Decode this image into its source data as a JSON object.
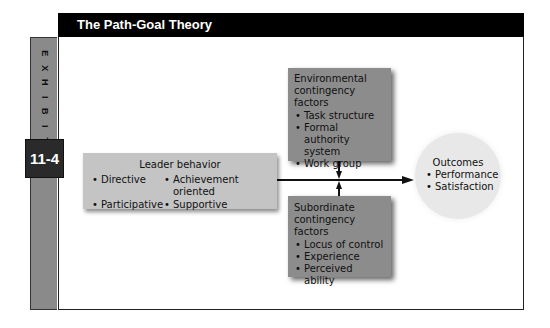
{
  "header": {
    "title": "The Path-Goal Theory"
  },
  "exhibit": {
    "letters": [
      "E",
      "X",
      "H",
      "I",
      "B",
      "I",
      "T"
    ],
    "number": "11-4"
  },
  "leader_behavior": {
    "title": "Leader behavior",
    "items": [
      "Directive",
      "Achievement oriented",
      "Participative",
      "Supportive"
    ]
  },
  "environmental": {
    "title_line1": "Environmental",
    "title_line2": "contingency factors",
    "items": [
      "Task structure",
      "Formal authority system",
      "Work group"
    ]
  },
  "subordinate": {
    "title_line1": "Subordinate",
    "title_line2": "contingency factors",
    "items": [
      "Locus of control",
      "Experience",
      "Perceived ability"
    ]
  },
  "outcomes": {
    "title": "Outcomes",
    "items": [
      "Performance",
      "Satisfaction"
    ]
  },
  "colors": {
    "header_bg": "#000000",
    "exhibit_column": "#8a8a8a",
    "badge_bg": "#2a2a2a",
    "leader_box": "#c4c4c4",
    "contingency_box": "#8c8c8c",
    "outcomes_circle": "#e8e8e8"
  }
}
